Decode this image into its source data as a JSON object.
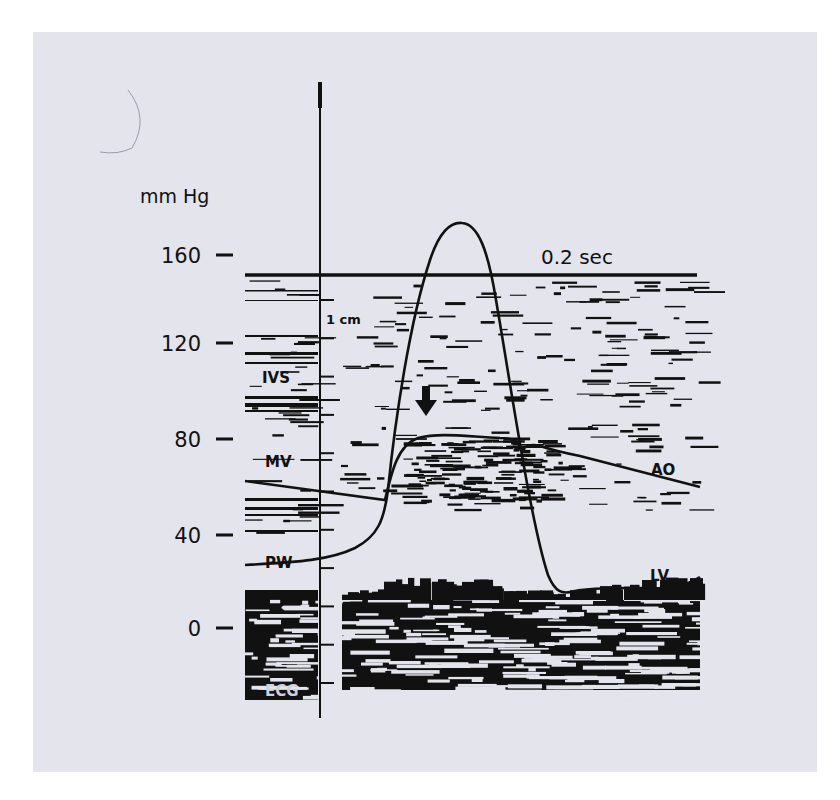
{
  "figure": {
    "y_axis_unit": "mm Hg",
    "y_ticks": [
      {
        "value": 160,
        "label": "160",
        "y": 255
      },
      {
        "value": 120,
        "label": "120",
        "y": 343
      },
      {
        "value": 80,
        "label": "80",
        "y": 439
      },
      {
        "value": 40,
        "label": "40",
        "y": 535
      },
      {
        "value": 0,
        "label": "0",
        "y": 628
      }
    ],
    "time_scale_label": "0.2 sec",
    "distance_scale_label": "1 cm",
    "structure_labels": {
      "ivs": "IVS",
      "mv": "MV",
      "pw": "PW",
      "ecg": "ECG"
    },
    "curve_labels": {
      "ao": "AO",
      "lv": "LV"
    },
    "colors": {
      "background": "#e3e4ec",
      "ink": "#111111"
    }
  },
  "chart_data": {
    "type": "line",
    "title": "",
    "xlabel": "time (0.2 sec scale)",
    "ylabel": "mm Hg",
    "ylim": [
      0,
      175
    ],
    "y_ticks": [
      0,
      40,
      80,
      120,
      160
    ],
    "grid": false,
    "legend": "inline labels (AO, LV)",
    "annotations": [
      "IVS",
      "MV",
      "PW",
      "ECG",
      "1 cm",
      "0.2 sec",
      "arrow at aortic valve opening"
    ],
    "x": [
      0,
      0.1,
      0.2,
      0.3,
      0.35,
      0.4,
      0.45,
      0.5,
      0.55,
      0.6,
      0.65,
      0.7,
      0.8,
      0.9,
      1.0
    ],
    "series": [
      {
        "name": "LV",
        "values": [
          12,
          14,
          20,
          40,
          95,
          150,
          172,
          160,
          110,
          40,
          5,
          8,
          10,
          12,
          20
        ]
      },
      {
        "name": "AO",
        "values": [
          63,
          60,
          58,
          56,
          78,
          82,
          82,
          81,
          80,
          79,
          72,
          65,
          58,
          52,
          58
        ]
      }
    ]
  }
}
